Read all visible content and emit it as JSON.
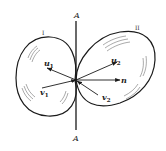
{
  "diagram": {
    "type": "collision-of-two-bodies",
    "axis_label_top": "A",
    "axis_label_bottom": "A",
    "bodies": [
      {
        "label": "I"
      },
      {
        "label": "II"
      }
    ],
    "vectors": {
      "u1": {
        "base": "u",
        "sub": "1"
      },
      "u2": {
        "base": "u",
        "sub": "2"
      },
      "v1": {
        "base": "v",
        "sub": "1"
      },
      "v2": {
        "base": "v",
        "sub": "2"
      },
      "n": {
        "base": "n"
      }
    },
    "colors": {
      "stroke": "#1a1a1a",
      "background": "#ffffff"
    }
  }
}
